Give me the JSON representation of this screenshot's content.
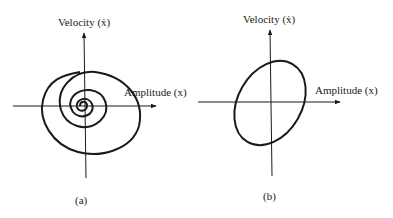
{
  "figure": {
    "panels": [
      {
        "id": "a",
        "caption": "(a)",
        "y_axis_label": "Velocity (ẋ)",
        "x_axis_label": "Amplitude (x)",
        "curve": "inward spiral (damped oscillation phase trajectory)"
      },
      {
        "id": "b",
        "caption": "(b)",
        "y_axis_label": "Velocity (ẋ)",
        "x_axis_label": "Amplitude (x)",
        "curve": "tilted closed ellipse (undamped periodic phase trajectory)"
      }
    ],
    "colors": {
      "ink": "#1a1a1a",
      "background": "#ffffff"
    }
  }
}
